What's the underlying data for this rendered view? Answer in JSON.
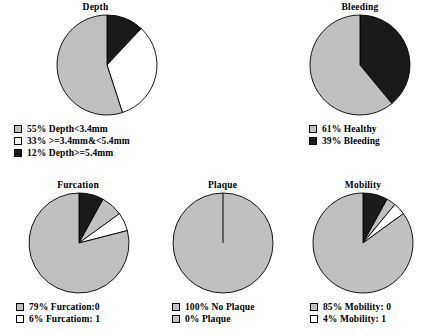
{
  "colors": {
    "gray": "#c0c0c0",
    "black": "#1a1a1a",
    "white": "#ffffff",
    "outline": "#000000",
    "background": "#ffffff"
  },
  "chart_data": [
    {
      "type": "pie",
      "id": "depth",
      "title": "Depth",
      "start_angle_deg": 0,
      "direction": "clockwise",
      "categories": [
        "Depth>=5.4mm",
        ">=3.4mm&<5.4mm",
        "Depth<3.4mm"
      ],
      "values": [
        12,
        33,
        55
      ],
      "slice_colors": [
        "#1a1a1a",
        "#ffffff",
        "#c0c0c0"
      ],
      "legend_position": "below",
      "legend": [
        {
          "swatch": "#c0c0c0",
          "label": "55% Depth<3.4mm"
        },
        {
          "swatch": "#ffffff",
          "label": "33% >=3.4mm&<5.4mm"
        },
        {
          "swatch": "#1a1a1a",
          "label": "12% Depth>=5.4mm"
        }
      ]
    },
    {
      "type": "pie",
      "id": "bleeding",
      "title": "Bleeding",
      "start_angle_deg": 0,
      "direction": "clockwise",
      "categories": [
        "Bleeding",
        "Healthy"
      ],
      "values": [
        39,
        61
      ],
      "slice_colors": [
        "#1a1a1a",
        "#c0c0c0"
      ],
      "legend_position": "below",
      "legend": [
        {
          "swatch": "#c0c0c0",
          "label": "61% Healthy"
        },
        {
          "swatch": "#1a1a1a",
          "label": "39% Bleeding"
        }
      ]
    },
    {
      "type": "pie",
      "id": "furcation",
      "title": "Furcation",
      "start_angle_deg": 0,
      "direction": "clockwise",
      "categories": [
        "black-wedge",
        "gray-wedge",
        "Furcation: 1",
        "Furcation:0"
      ],
      "values": [
        8,
        7,
        6,
        79
      ],
      "slice_colors": [
        "#1a1a1a",
        "#c0c0c0",
        "#ffffff",
        "#c0c0c0"
      ],
      "legend_position": "below",
      "legend": [
        {
          "swatch": "#c0c0c0",
          "label": "79% Furcation:0"
        },
        {
          "swatch": "#ffffff",
          "label": "6% Furcatiom: 1"
        }
      ]
    },
    {
      "type": "pie",
      "id": "plaque",
      "title": "Plaque",
      "start_angle_deg": 0,
      "direction": "clockwise",
      "categories": [
        "No Plaque",
        "Plaque"
      ],
      "values": [
        100,
        0
      ],
      "slice_colors": [
        "#c0c0c0",
        "#c0c0c0"
      ],
      "legend_position": "below",
      "legend": [
        {
          "swatch": "#c0c0c0",
          "label": "100% No Plaque"
        },
        {
          "swatch": "#c0c0c0",
          "label": "0% Plaque"
        }
      ]
    },
    {
      "type": "pie",
      "id": "mobility",
      "title": "Mobility",
      "start_angle_deg": 0,
      "direction": "clockwise",
      "categories": [
        "black-wedge",
        "gray-wedge",
        "Mobility: 1",
        "Mobility: 0"
      ],
      "values": [
        8,
        3,
        4,
        85
      ],
      "slice_colors": [
        "#1a1a1a",
        "#c0c0c0",
        "#ffffff",
        "#c0c0c0"
      ],
      "legend_position": "below",
      "legend": [
        {
          "swatch": "#c0c0c0",
          "label": "85% Mobility: 0"
        },
        {
          "swatch": "#ffffff",
          "label": "4% Mobility: 1"
        }
      ]
    }
  ]
}
